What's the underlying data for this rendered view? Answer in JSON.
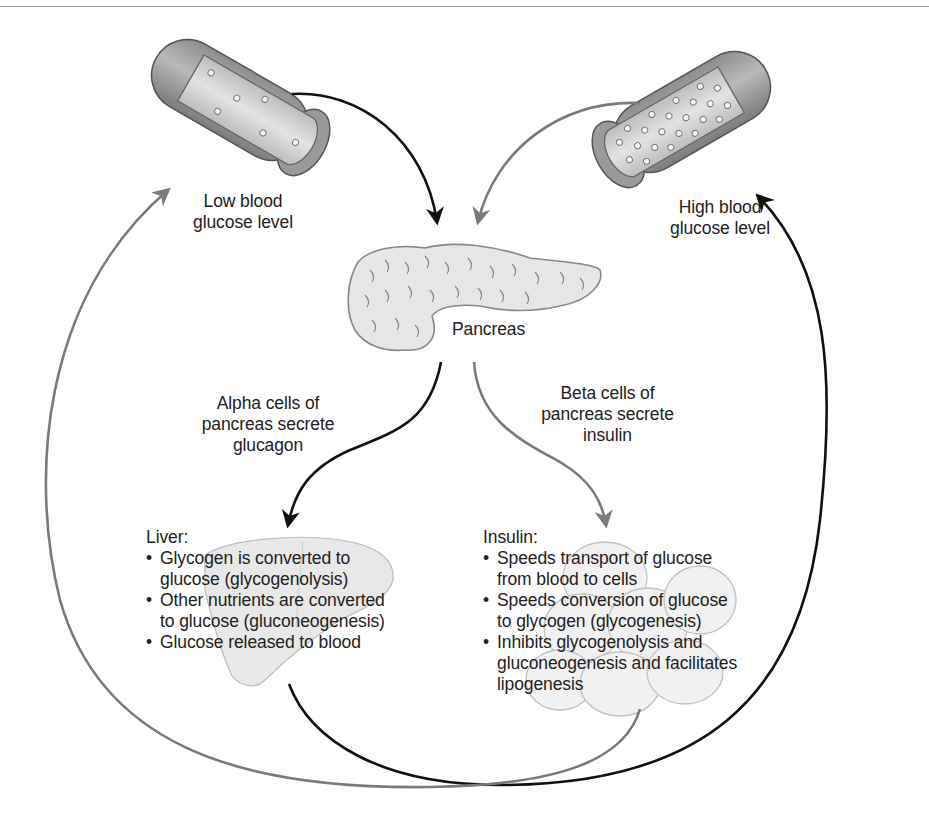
{
  "diagram": {
    "title_partial": "",
    "nodes": {
      "low_vessel": {
        "label": "Low blood glucose level",
        "line1": "Low blood",
        "line2": "glucose level",
        "icon": "blood-vessel-low-glucose"
      },
      "high_vessel": {
        "label": "High blood glucose level",
        "line1": "High blood",
        "line2": "glucose level",
        "icon": "blood-vessel-high-glucose"
      },
      "pancreas": {
        "label": "Pancreas",
        "icon": "pancreas"
      },
      "alpha": {
        "line1": "Alpha cells of",
        "line2": "pancreas secrete",
        "line3": "glucagon"
      },
      "beta": {
        "line1": "Beta cells of",
        "line2": "pancreas secrete",
        "line3": "insulin"
      },
      "liver": {
        "heading": "Liver:",
        "icon": "liver",
        "items": [
          {
            "line1": "Glycogen is converted to",
            "line2": "glucose (glycogenolysis)"
          },
          {
            "line1": "Other nutrients are converted",
            "line2": "to glucose (gluconeogenesis)"
          },
          {
            "line1": "Glucose released to blood",
            "line2": ""
          }
        ]
      },
      "insulin": {
        "heading": "Insulin:",
        "icon": "fat-cells",
        "items": [
          {
            "line1": "Speeds transport of glucose",
            "line2": "from blood to cells"
          },
          {
            "line1": "Speeds conversion of glucose",
            "line2": "to glycogen (glycogenesis)"
          },
          {
            "line1": "Inhibits glycogenolysis and",
            "line2": "gluconeogenesis and facilitates",
            "line3": "lipogenesis"
          }
        ]
      }
    },
    "edges": [
      {
        "from": "Low blood glucose level",
        "to": "Pancreas",
        "color": "#111111"
      },
      {
        "from": "High blood glucose level",
        "to": "Pancreas",
        "color": "#777777"
      },
      {
        "from": "Pancreas",
        "to": "Liver",
        "via": "Alpha cells secrete glucagon",
        "color": "#111111"
      },
      {
        "from": "Pancreas",
        "to": "Insulin",
        "via": "Beta cells secrete insulin",
        "color": "#777777"
      },
      {
        "from": "Liver",
        "to": "High blood glucose level",
        "color": "#111111"
      },
      {
        "from": "Insulin",
        "to": "Low blood glucose level",
        "color": "#777777"
      }
    ],
    "colors": {
      "black_arrow": "#111111",
      "gray_arrow": "#777777",
      "organ_fill": "#e4e4e4",
      "organ_stroke": "#8a8a8a"
    }
  }
}
